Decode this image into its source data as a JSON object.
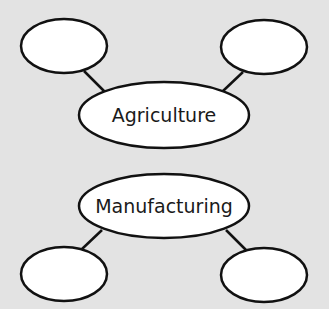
{
  "diagram": {
    "background": "#e3e3e3",
    "stroke_color": "#111111",
    "fill_color": "#ffffff",
    "groups": [
      {
        "central": {
          "label": "Agriculture",
          "cx": 164,
          "cy": 115,
          "rx": 85,
          "ry": 33
        },
        "branches": [
          {
            "label": "",
            "cx": 64,
            "cy": 46,
            "rx": 43,
            "ry": 27,
            "line": [
              84,
              71,
              105,
              92
            ]
          },
          {
            "label": "",
            "cx": 264,
            "cy": 47,
            "rx": 43,
            "ry": 27,
            "line": [
              243,
              72,
              223,
              91
            ]
          }
        ]
      },
      {
        "central": {
          "label": "Manufacturing",
          "cx": 164,
          "cy": 206,
          "rx": 85,
          "ry": 32
        },
        "branches": [
          {
            "label": "",
            "cx": 64,
            "cy": 274,
            "rx": 43,
            "ry": 27,
            "line": [
              102,
              230,
              82,
              249
            ]
          },
          {
            "label": "",
            "cx": 264,
            "cy": 275,
            "rx": 43,
            "ry": 27,
            "line": [
              226,
              230,
              246,
              250
            ]
          }
        ]
      }
    ]
  }
}
